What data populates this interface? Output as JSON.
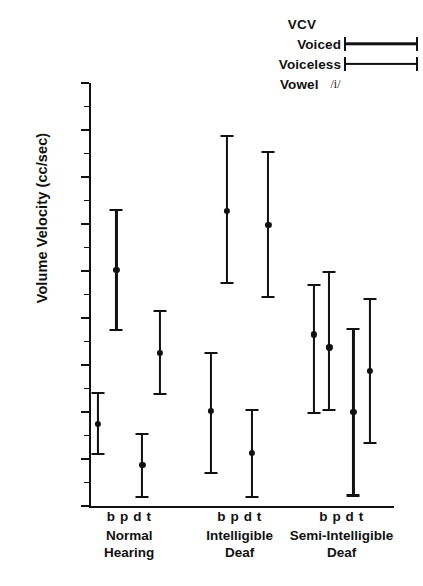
{
  "legend": {
    "title": "VCV",
    "voiced_label": "Voiced",
    "voiceless_label": "Voiceless",
    "vowel_label": "Vowel",
    "vowel_value": "/i/"
  },
  "axes": {
    "ylabel": "Volume Velocity (cc/sec)",
    "yticks": [
      "2200",
      "2000",
      "1800",
      "1600",
      "1400",
      "1200",
      "1000",
      "800",
      "600",
      "400"
    ]
  },
  "groups": [
    {
      "name_line1": "Normal",
      "name_line2": "Hearing",
      "phonemes": "b p   d t"
    },
    {
      "name_line1": "Intelligible",
      "name_line2": "Deaf",
      "phonemes": "b p   d t"
    },
    {
      "name_line1": "Semi-Intelligible",
      "name_line2": "Deaf",
      "phonemes": "b p   d t"
    }
  ],
  "chart_data": {
    "type": "scatter",
    "title": "",
    "xlabel": "",
    "ylabel": "Volume Velocity (cc/sec)",
    "ylim": [
      400,
      2200
    ],
    "ytick_step": 200,
    "yminor_step": 100,
    "grid": false,
    "legend_position": "top-right",
    "error_bar_style": "mean with range caps",
    "categories": [
      "Normal Hearing b",
      "Normal Hearing p",
      "Normal Hearing d",
      "Normal Hearing t",
      "Intelligible Deaf b",
      "Intelligible Deaf p",
      "Intelligible Deaf d",
      "Intelligible Deaf t",
      "Semi-Intelligible Deaf b",
      "Semi-Intelligible Deaf p",
      "Semi-Intelligible Deaf d",
      "Semi-Intelligible Deaf t"
    ],
    "points": [
      {
        "group": "Normal Hearing",
        "phoneme": "b",
        "voicing": "voiced",
        "x": 0.03,
        "value": 750,
        "low": 620,
        "high": 880
      },
      {
        "group": "Normal Hearing",
        "phoneme": "p",
        "voicing": "voiceless",
        "x": 0.09,
        "value": 1405,
        "low": 1150,
        "high": 1660
      },
      {
        "group": "Normal Hearing",
        "phoneme": "d",
        "voicing": "voiced",
        "x": 0.175,
        "value": 575,
        "low": 440,
        "high": 705
      },
      {
        "group": "Normal Hearing",
        "phoneme": "t",
        "voicing": "voiceless",
        "x": 0.232,
        "value": 1050,
        "low": 875,
        "high": 1230
      },
      {
        "group": "Intelligible Deaf",
        "phoneme": "b",
        "voicing": "voiced",
        "x": 0.4,
        "value": 805,
        "low": 540,
        "high": 1050
      },
      {
        "group": "Intelligible Deaf",
        "phoneme": "p",
        "voicing": "voiceless",
        "x": 0.452,
        "value": 1655,
        "low": 1350,
        "high": 1975
      },
      {
        "group": "Intelligible Deaf",
        "phoneme": "d",
        "voicing": "voiced",
        "x": 0.535,
        "value": 625,
        "low": 440,
        "high": 810
      },
      {
        "group": "Intelligible Deaf",
        "phoneme": "t",
        "voicing": "voiceless",
        "x": 0.588,
        "value": 1595,
        "low": 1290,
        "high": 1905
      },
      {
        "group": "Semi-Intelligible Deaf",
        "phoneme": "b",
        "voicing": "voiced",
        "x": 0.737,
        "value": 1130,
        "low": 795,
        "high": 1340
      },
      {
        "group": "Semi-Intelligible Deaf",
        "phoneme": "p",
        "voicing": "voiceless",
        "x": 0.788,
        "value": 1075,
        "low": 810,
        "high": 1395
      },
      {
        "group": "Semi-Intelligible Deaf",
        "phoneme": "d",
        "voicing": "voiced",
        "x": 0.867,
        "value": 800,
        "low": 445,
        "high": 1155
      },
      {
        "group": "Semi-Intelligible Deaf",
        "phoneme": "t",
        "voicing": "voiceless",
        "x": 0.92,
        "value": 975,
        "low": 670,
        "high": 1280
      }
    ]
  },
  "style": {
    "ink": "#111111"
  }
}
